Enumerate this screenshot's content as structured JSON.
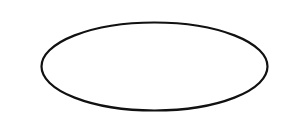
{
  "canvas": {
    "width": 288,
    "height": 135,
    "background": "#ffffff"
  },
  "shapes": [
    {
      "type": "ellipse",
      "cx": 154.5,
      "cy": 66.5,
      "rx": 113,
      "ry": 44,
      "stroke": "#111111",
      "stroke_width": 2.2,
      "fill": "#ffffff"
    }
  ]
}
